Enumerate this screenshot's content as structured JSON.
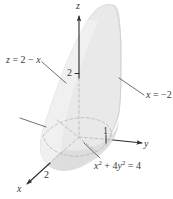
{
  "figure": {
    "kind": "3d-solid-diagram",
    "width": 173,
    "height": 199,
    "background_color": "#ffffff",
    "surface_fill_color": "#e9e9e9",
    "surface_fill_color_dark": "#dcdcdc",
    "surface_edge_color": "#c8c8c8",
    "axis_color": "#2b2b2b",
    "dashed_color": "#b4b4b4",
    "leader_color": "#4a4a4a",
    "text_color": "#3b3b3b"
  },
  "axes": {
    "z": {
      "label": "z",
      "direction": "up",
      "tick_label": "2",
      "tick_value": 2
    },
    "y": {
      "label": "y",
      "direction": "right",
      "tick_label": "1",
      "tick_value": 1
    },
    "x": {
      "label": "x",
      "direction": "down-left",
      "tick_label": "2",
      "tick_value": 2
    }
  },
  "annotations": {
    "plane_label": {
      "text_parts": {
        "lhs": "z",
        "eq": " = ",
        "rhs_a": "2",
        "minus": " − ",
        "rhs_b": "x"
      },
      "full_text": "z = 2 − x",
      "has_leader_line": true
    },
    "plane_x_label": {
      "text_parts": {
        "lhs": "x",
        "eq": " = ",
        "rhs": "−2"
      },
      "full_text": "x = −2",
      "has_leader_line": true
    },
    "cylinder_label": {
      "text_parts": {
        "term1_base": "x",
        "term1_exp": "2",
        "plus": " + ",
        "term2_coef": "4",
        "term2_base": "y",
        "term2_exp": "2",
        "eq": " = ",
        "rhs": "4"
      },
      "full_text": "x² + 4y² = 4",
      "has_leader_line": true
    },
    "unlabeled_leader": {
      "text": "",
      "has_leader_line": true
    }
  }
}
